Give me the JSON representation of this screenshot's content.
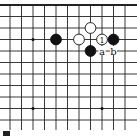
{
  "diagram": {
    "type": "go-board-fragment",
    "grid": {
      "x_lines": [
        10,
        21.5,
        33,
        44.5,
        56,
        67.5,
        79,
        90.5,
        102,
        113.5,
        125
      ],
      "y_lines": [
        5,
        16.5,
        28,
        39.5,
        51,
        62.5,
        74,
        85.5,
        97,
        108.5,
        120
      ],
      "top_edge": true,
      "line_color": "#222222"
    },
    "star_points": [
      {
        "col": 2,
        "row": 3
      },
      {
        "col": 2,
        "row": 9
      },
      {
        "col": 8,
        "row": 9
      }
    ],
    "stones": [
      {
        "color": "black",
        "col": 4,
        "row": 3,
        "label": ""
      },
      {
        "color": "white",
        "col": 6,
        "row": 3,
        "label": ""
      },
      {
        "color": "white",
        "col": 7,
        "row": 2,
        "label": ""
      },
      {
        "color": "white",
        "col": 8,
        "row": 3,
        "label": "1"
      },
      {
        "color": "black",
        "col": 9,
        "row": 3,
        "label": ""
      },
      {
        "color": "black",
        "col": 7,
        "row": 4,
        "label": ""
      }
    ],
    "markers": [
      {
        "text": "a",
        "col": 8,
        "row": 4
      },
      {
        "text": "b",
        "col": 9,
        "row": 4
      }
    ]
  }
}
